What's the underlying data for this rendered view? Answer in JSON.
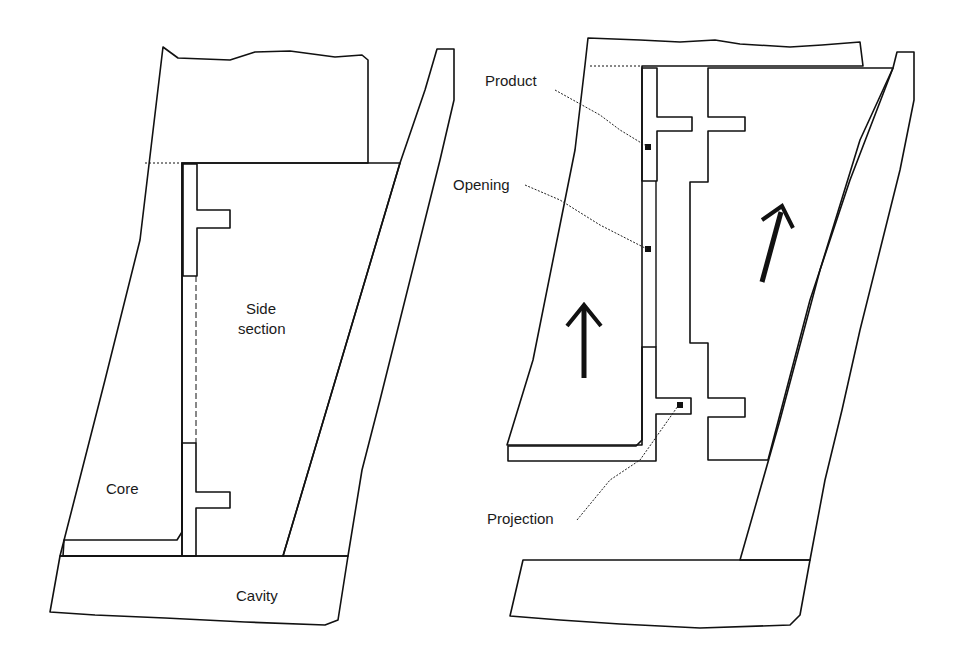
{
  "figure": {
    "left_panel": {
      "labels": {
        "side_section": [
          "Side",
          "section"
        ],
        "core": "Core",
        "cavity": "Cavity"
      }
    },
    "right_panel": {
      "labels": {
        "product": "Product",
        "opening": "Opening",
        "projection": "Projection"
      },
      "arrows": [
        "core-arrow-up",
        "side-section-arrow-up"
      ]
    }
  },
  "colors": {
    "line": "#111111",
    "background": "#ffffff"
  }
}
